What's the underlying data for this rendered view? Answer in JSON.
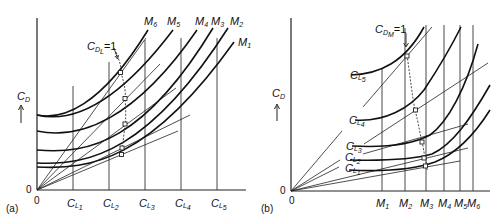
{
  "figure": {
    "panel_a": {
      "tag": "(a)",
      "y_axis_label": "C",
      "y_axis_sub": "D",
      "origin_x_label": "0",
      "origin_y_label": "0",
      "x_ticks": [
        {
          "main": "C",
          "sub": "L",
          "idx": "1"
        },
        {
          "main": "C",
          "sub": "L",
          "idx": "2"
        },
        {
          "main": "C",
          "sub": "L",
          "idx": "3"
        },
        {
          "main": "C",
          "sub": "L",
          "idx": "4"
        },
        {
          "main": "C",
          "sub": "L",
          "idx": "5"
        }
      ],
      "curve_labels": [
        {
          "main": "M",
          "idx": "6"
        },
        {
          "main": "M",
          "idx": "5"
        },
        {
          "main": "M",
          "idx": "4"
        },
        {
          "main": "M",
          "idx": "3"
        },
        {
          "main": "M",
          "idx": "2"
        },
        {
          "main": "M",
          "idx": "1"
        }
      ],
      "annotation": {
        "main": "C",
        "sub": "D",
        "subsub": "L",
        "suffix": "=1"
      }
    },
    "panel_b": {
      "tag": "(b)",
      "y_axis_label": "C",
      "y_axis_sub": "D",
      "origin_x_label": "0",
      "origin_y_label": "0",
      "x_ticks": [
        {
          "main": "M",
          "idx": "1"
        },
        {
          "main": "M",
          "idx": "2"
        },
        {
          "main": "M",
          "idx": "3"
        },
        {
          "main": "M",
          "idx": "4"
        },
        {
          "main": "M",
          "idx": "5"
        },
        {
          "main": "M",
          "idx": "6"
        }
      ],
      "curve_labels": [
        {
          "main": "C",
          "sub": "L",
          "idx": "5"
        },
        {
          "main": "C",
          "sub": "L",
          "idx": "4"
        },
        {
          "main": "C",
          "sub": "L",
          "idx": "3"
        },
        {
          "main": "C",
          "sub": "L",
          "idx": "2"
        },
        {
          "main": "C",
          "sub": "L",
          "idx": "1"
        }
      ],
      "annotation": {
        "main": "C",
        "sub": "D",
        "subsub": "M",
        "suffix": "=1"
      }
    }
  }
}
